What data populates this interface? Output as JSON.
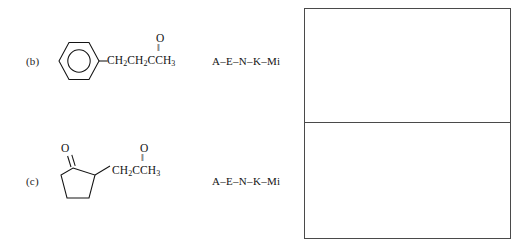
{
  "worksheet": {
    "background_color": "#ffffff",
    "ink_color": "#141414",
    "rule_color": "#4a4a4a"
  },
  "items": [
    {
      "id": "item-b",
      "label": "(b)",
      "structure": {
        "name": "4-phenyl-2-butanone",
        "ring": "benzene-ring",
        "ring_notation": "hexagon-with-inner-circle",
        "chain_text": "CH2CH2CCH3",
        "chain_parts": [
          "CH",
          "2",
          "CH",
          "2",
          "CCH",
          "3"
        ],
        "carbonyl_oxygen": "O",
        "double_bond_glyph": "‖"
      },
      "answer_code": "A–E–N–K–Mi"
    },
    {
      "id": "item-c",
      "label": "(c)",
      "structure": {
        "name": "2-(2-oxopropyl)cyclopentan-1-one",
        "ring": "cyclopentanone-ring",
        "ring_notation": "pentagon-with-ketone",
        "ring_carbonyl_oxygen": "O",
        "chain_text": "CH2CCH3",
        "chain_parts": [
          "CH",
          "2",
          "CCH",
          "3"
        ],
        "carbonyl_oxygen": "O",
        "double_bond_glyph": "‖"
      },
      "answer_code": "A–E–N–K–Mi"
    }
  ],
  "answer_boxes": [
    {
      "id": "answer-box-top",
      "content": ""
    },
    {
      "id": "answer-box-bottom",
      "content": ""
    }
  ]
}
